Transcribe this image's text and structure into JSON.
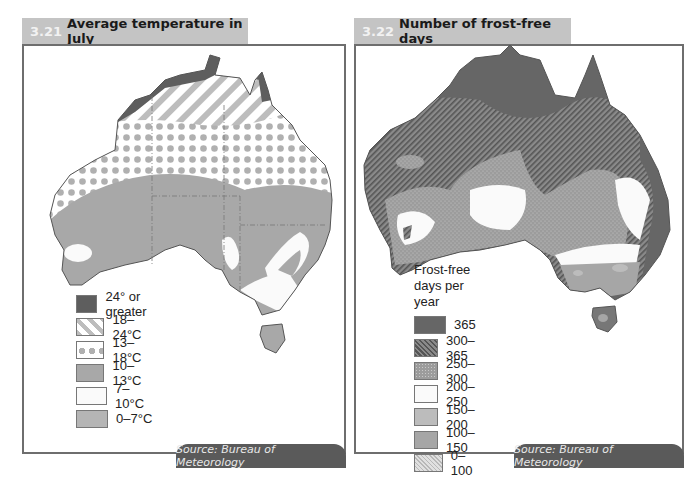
{
  "maps": [
    {
      "number": "3.21",
      "title": "Average temperature in July",
      "source": "Source: Bureau of Meteorology",
      "legend": {
        "title": "",
        "items": [
          {
            "label": "24° or greater",
            "pattern": "solid-dark",
            "color": "#5e5e5e"
          },
          {
            "label": "18–24°C",
            "pattern": "diagonal-stripes",
            "color": "#bdbdbd"
          },
          {
            "label": "13–18°C",
            "pattern": "dots",
            "color": "#b0b0b0"
          },
          {
            "label": "10–13°C",
            "pattern": "solid-mid",
            "color": "#a8a8a8"
          },
          {
            "label": "7–10°C",
            "pattern": "solid-white",
            "color": "#fafafa"
          },
          {
            "label": "0–7°C",
            "pattern": "solid-light",
            "color": "#b5b5b5"
          }
        ]
      }
    },
    {
      "number": "3.22",
      "title": "Number of frost-free days",
      "source": "Source: Bureau of Meteorology",
      "legend": {
        "title_line1": "Frost-free",
        "title_line2": "days per year",
        "items": [
          {
            "label": "365",
            "pattern": "solid-dark",
            "color": "#666666"
          },
          {
            "label": "300–365",
            "pattern": "dense-hatch",
            "color": "#6f6f6f"
          },
          {
            "label": "250–300",
            "pattern": "stipple",
            "color": "#9a9a9a"
          },
          {
            "label": "200–250",
            "pattern": "solid-white",
            "color": "#fafafa"
          },
          {
            "label": "150–200",
            "pattern": "solid-light",
            "color": "#bcbcbc"
          },
          {
            "label": "100–150",
            "pattern": "solid-mid",
            "color": "#a6a6a6"
          },
          {
            "label": "0–100",
            "pattern": "light-hatch",
            "color": "#cfcfcf"
          }
        ]
      }
    }
  ]
}
